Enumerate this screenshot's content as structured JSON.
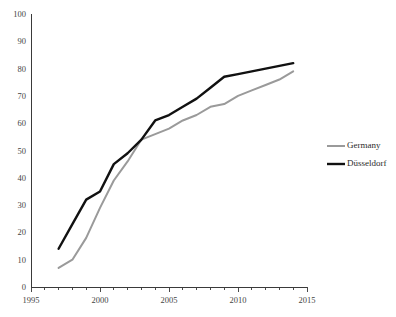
{
  "chart_data": {
    "type": "line",
    "title": "",
    "xlabel": "",
    "ylabel": "",
    "xlim": [
      1995,
      2015
    ],
    "ylim": [
      0,
      100
    ],
    "grid": false,
    "legend_position": "right",
    "x_ticks": [
      1995,
      2000,
      2005,
      2010,
      2015
    ],
    "x_minor_tick_step": 1,
    "y_ticks": [
      0,
      10,
      20,
      30,
      40,
      50,
      60,
      70,
      80,
      90,
      100
    ],
    "x_tick_labels": [
      "1995",
      "2000",
      "2005",
      "2010",
      "2015"
    ],
    "y_tick_labels": [
      "0",
      "10",
      "20",
      "30",
      "40",
      "50",
      "60",
      "70",
      "80",
      "90",
      "100"
    ],
    "series": [
      {
        "name": "Germany",
        "color": "#9a9a9a",
        "width": 2.0,
        "x": [
          1997,
          1998,
          1999,
          2000,
          2001,
          2002,
          2003,
          2004,
          2005,
          2006,
          2007,
          2008,
          2009,
          2010,
          2011,
          2012,
          2013,
          2014
        ],
        "values": [
          7,
          10,
          18,
          29,
          39,
          46,
          54,
          56,
          58,
          61,
          63,
          66,
          67,
          70,
          72,
          74,
          76,
          79
        ]
      },
      {
        "name": "Düsseldorf",
        "color": "#111111",
        "width": 2.4,
        "x": [
          1997,
          1998,
          1999,
          2000,
          2001,
          2002,
          2003,
          2004,
          2005,
          2006,
          2007,
          2008,
          2009,
          2010,
          2011,
          2012,
          2013,
          2014
        ],
        "values": [
          14,
          23,
          32,
          35,
          45,
          49,
          54,
          61,
          63,
          66,
          69,
          73,
          77,
          78,
          79,
          80,
          81,
          82
        ]
      }
    ]
  },
  "legend": {
    "items": [
      {
        "label": "Germany",
        "color": "#9a9a9a",
        "width": 2.0
      },
      {
        "label": "Düsseldorf",
        "color": "#111111",
        "width": 2.4
      }
    ]
  },
  "axes": {
    "y_axis_name": "value-axis",
    "x_axis_name": "year-axis"
  }
}
